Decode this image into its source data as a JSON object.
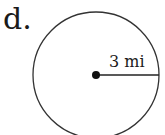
{
  "problem_label": "d.",
  "figure": {
    "shape": "circle",
    "radius_label": "3 mi",
    "radius_value": 3,
    "unit": "mi",
    "stroke_color": "#333333",
    "center_dot_color": "#111111"
  }
}
